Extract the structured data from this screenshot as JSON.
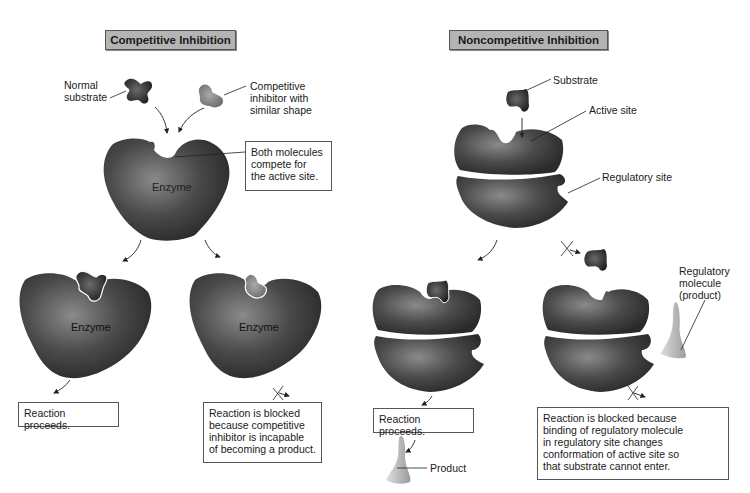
{
  "competitive": {
    "title": "Competitive Inhibition",
    "labels": {
      "normal_substrate": "Normal\nsubstrate",
      "competitive_inhibitor": "Competitive\ninhibitor with\nsimilar shape",
      "both_compete": "Both molecules\ncompete for\nthe active site.",
      "enzyme_top": "Enzyme",
      "enzyme_left": "Enzyme",
      "enzyme_right": "Enzyme",
      "reaction_proceeds": "Reaction proceeds.",
      "reaction_blocked": "Reaction is blocked\nbecause competitive\ninhibitor is incapable\nof becoming a product."
    }
  },
  "noncompetitive": {
    "title": "Noncompetitive Inhibition",
    "labels": {
      "substrate": "Substrate",
      "active_site": "Active site",
      "regulatory_site": "Regulatory site",
      "regulatory_molecule": "Regulatory\nmolecule\n(product)",
      "reaction_proceeds": "Reaction proceeds.",
      "product": "Product",
      "reaction_blocked": "Reaction is blocked because\nbinding of regulatory molecule\nin regulatory site changes\nconformation of active site so\nthat substrate cannot enter."
    }
  },
  "colors": {
    "title_bg": "#b4b4b4",
    "enzyme": "#4a4a4a",
    "substrate": "#3a3a3a",
    "inhibitor": "#8a8a8a",
    "regulatory": "#c8c8c8"
  }
}
